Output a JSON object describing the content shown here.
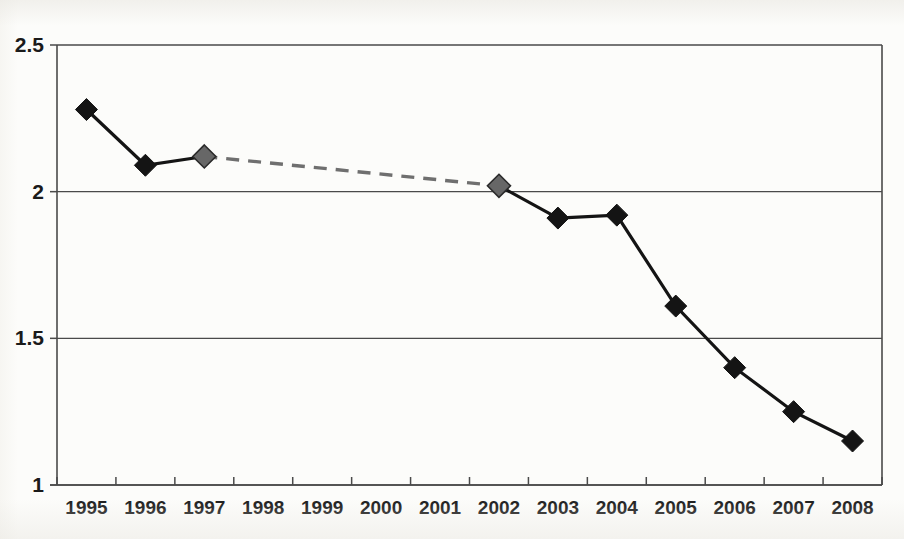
{
  "chart_data": {
    "type": "line",
    "title": "",
    "subtitle": "",
    "xlabel": "",
    "ylabel": "",
    "categories": [
      "1995",
      "1996",
      "1997",
      "1998",
      "1999",
      "2000",
      "2001",
      "2002",
      "2003",
      "2004",
      "2005",
      "2006",
      "2007",
      "2008"
    ],
    "values": [
      2.28,
      2.09,
      2.12,
      null,
      null,
      null,
      null,
      2.02,
      1.91,
      1.92,
      1.61,
      1.4,
      1.25,
      1.15
    ],
    "series": [
      {
        "name": "series-1",
        "points": [
          {
            "x": "1995",
            "y": 2.28,
            "marker": "dark"
          },
          {
            "x": "1996",
            "y": 2.09,
            "marker": "dark"
          },
          {
            "x": "1997",
            "y": 2.12,
            "marker": "gray"
          },
          {
            "x": "1998",
            "y": null,
            "marker": "none"
          },
          {
            "x": "1999",
            "y": null,
            "marker": "none"
          },
          {
            "x": "2000",
            "y": null,
            "marker": "none"
          },
          {
            "x": "2001",
            "y": null,
            "marker": "none"
          },
          {
            "x": "2002",
            "y": 2.02,
            "marker": "gray"
          },
          {
            "x": "2003",
            "y": 1.91,
            "marker": "dark"
          },
          {
            "x": "2004",
            "y": 1.92,
            "marker": "dark"
          },
          {
            "x": "2005",
            "y": 1.61,
            "marker": "dark"
          },
          {
            "x": "2006",
            "y": 1.4,
            "marker": "dark"
          },
          {
            "x": "2007",
            "y": 1.25,
            "marker": "dark"
          },
          {
            "x": "2008",
            "y": 1.15,
            "marker": "dark"
          }
        ]
      }
    ],
    "segments": [
      {
        "name": "observed-early",
        "style": "solid",
        "from": "1995",
        "to": "1997"
      },
      {
        "name": "interpolated-gap",
        "style": "dashed",
        "from": "1997",
        "to": "2002"
      },
      {
        "name": "observed-late",
        "style": "solid",
        "from": "2002",
        "to": "2008"
      }
    ],
    "ylim": [
      1,
      2.5
    ],
    "yticks": [
      1,
      1.5,
      2,
      2.5
    ],
    "ytick_labels": [
      "1",
      "1.5",
      "2",
      "2.5"
    ],
    "xtick_labels": [
      "1995",
      "1996",
      "1997",
      "1998",
      "1999",
      "2000",
      "2001",
      "2002",
      "2003",
      "2004",
      "2005",
      "2006",
      "2007",
      "2008"
    ],
    "grid": true,
    "grid_axis": "y",
    "legend": false,
    "legend_position": "none",
    "colors": {
      "line_solid": "#141414",
      "line_dashed": "#6f6f6f",
      "marker_dark": "#141414",
      "marker_gray": "#676767",
      "axis": "#4a4a4a",
      "text": "#1a1a1a",
      "background": "#fcfcfa"
    },
    "annotations": []
  },
  "figure": {
    "plot_left": 57,
    "plot_right": 882,
    "plot_top": 45,
    "plot_bottom": 485
  }
}
